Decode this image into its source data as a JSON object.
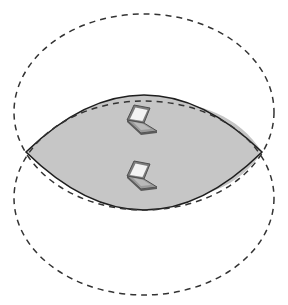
{
  "diagram": {
    "description": "Overlapping coverage areas of two wireless devices",
    "colors": {
      "background": "#ffffff",
      "coverage_outline": "#333333",
      "overlap_fill": "#c6c6c6",
      "overlap_outline": "#1e1e1e",
      "laptop_body": "#8a8a8a",
      "laptop_screen": "#f2f2f2",
      "laptop_edge": "#555555"
    },
    "coverage_areas": [
      {
        "id": "top",
        "cx": 144,
        "cy": 112,
        "rx": 130,
        "ry": 98,
        "style": "dashed"
      },
      {
        "id": "bottom",
        "cx": 144,
        "cy": 198,
        "rx": 130,
        "ry": 97,
        "style": "dashed"
      }
    ],
    "overlap_region": {
      "shape": "lens",
      "left_tip": [
        26,
        152
      ],
      "right_tip": [
        262,
        152
      ],
      "top_y": 97,
      "bottom_y": 212
    },
    "devices": [
      {
        "type": "laptop-icon",
        "x": 140,
        "y": 121
      },
      {
        "type": "laptop-icon",
        "x": 140,
        "y": 177
      }
    ]
  }
}
